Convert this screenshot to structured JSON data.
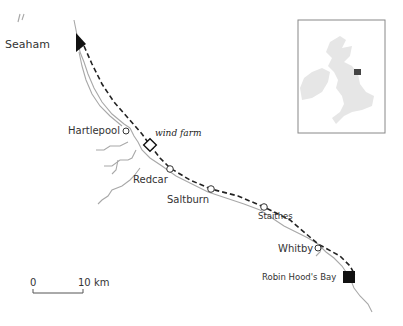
{
  "map": {
    "places": [
      {
        "id": "seaham",
        "label": "Seaham",
        "marker": "start-flag"
      },
      {
        "id": "hartlepool",
        "label": "Hartlepool",
        "marker": "circle"
      },
      {
        "id": "wind_farm",
        "label": "wind farm",
        "marker": "diamond"
      },
      {
        "id": "redcar",
        "label": "Redcar",
        "marker": "circle"
      },
      {
        "id": "saltburn",
        "label": "Saltburn",
        "marker": "circle"
      },
      {
        "id": "staithes",
        "label": "Staithes",
        "marker": "circle"
      },
      {
        "id": "whitby",
        "label": "Whitby",
        "marker": "circle"
      },
      {
        "id": "robin_hoods_bay",
        "label": "Robin Hood's Bay",
        "marker": "end-square"
      }
    ],
    "scale_bar": {
      "start_label": "0",
      "end_label": "10 km"
    },
    "inset": {
      "description": "British Isles locator map",
      "highlight_color": "#444444"
    },
    "colors": {
      "route": "#222222",
      "coast": "#a8a8a8",
      "land_inset": "#e6e6e6",
      "frame": "#888888"
    }
  }
}
